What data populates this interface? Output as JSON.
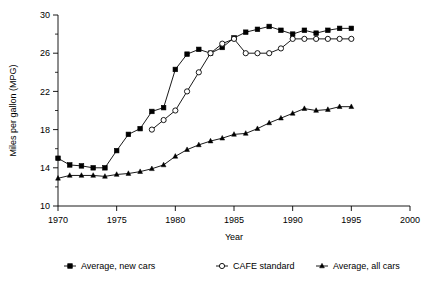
{
  "chart_data": {
    "type": "line",
    "title": "",
    "xlabel": "Year",
    "ylabel": "Miles per gallon (MPG)",
    "xlim": [
      1970,
      2000
    ],
    "ylim": [
      10,
      30
    ],
    "xticks": [
      1970,
      1975,
      1980,
      1985,
      1990,
      1995,
      2000
    ],
    "xtick_labels": [
      "1970",
      "1975",
      "1980",
      "1985",
      "1990",
      "1995",
      "2000"
    ],
    "yticks": [
      10,
      14,
      18,
      22,
      26,
      30
    ],
    "ytick_labels": [
      "10",
      "14",
      "18",
      "22",
      "26",
      "30"
    ],
    "yminor_ticks": [
      12,
      16,
      20,
      24,
      28
    ],
    "grid": false,
    "legend_position": "below",
    "series": [
      {
        "name": "Average, new cars",
        "marker": "filled-square",
        "color": "#000000",
        "x": [
          1970,
          1971,
          1972,
          1973,
          1974,
          1975,
          1976,
          1977,
          1978,
          1979,
          1980,
          1981,
          1982,
          1983,
          1984,
          1985,
          1986,
          1987,
          1988,
          1989,
          1990,
          1991,
          1992,
          1993,
          1994,
          1995
        ],
        "y": [
          15.0,
          14.3,
          14.2,
          14.0,
          14.0,
          15.8,
          17.5,
          18.1,
          19.9,
          20.3,
          24.3,
          25.9,
          26.4,
          26.0,
          26.6,
          27.6,
          28.2,
          28.5,
          28.8,
          28.4,
          28.0,
          28.4,
          28.1,
          28.4,
          28.6,
          28.6
        ]
      },
      {
        "name": "CAFE standard",
        "marker": "open-circle",
        "color": "#000000",
        "x": [
          1978,
          1979,
          1980,
          1981,
          1982,
          1983,
          1984,
          1985,
          1986,
          1987,
          1988,
          1989,
          1990,
          1991,
          1992,
          1993,
          1994,
          1995
        ],
        "y": [
          18.0,
          19.0,
          20.0,
          22.0,
          24.0,
          26.0,
          27.0,
          27.5,
          26.0,
          26.0,
          26.0,
          26.5,
          27.5,
          27.5,
          27.5,
          27.5,
          27.5,
          27.5
        ]
      },
      {
        "name": "Average, all cars",
        "marker": "filled-triangle",
        "color": "#000000",
        "x": [
          1970,
          1971,
          1972,
          1973,
          1974,
          1975,
          1976,
          1977,
          1978,
          1979,
          1980,
          1981,
          1982,
          1983,
          1984,
          1985,
          1986,
          1987,
          1988,
          1989,
          1990,
          1991,
          1992,
          1993,
          1994,
          1995
        ],
        "y": [
          12.9,
          13.2,
          13.2,
          13.2,
          13.1,
          13.3,
          13.4,
          13.6,
          13.9,
          14.3,
          15.2,
          15.9,
          16.4,
          16.8,
          17.1,
          17.5,
          17.6,
          18.1,
          18.7,
          19.2,
          19.7,
          20.2,
          20.0,
          20.1,
          20.4,
          20.4
        ]
      }
    ]
  },
  "legend": {
    "items": [
      {
        "label": "Average, new cars",
        "marker": "filled-square"
      },
      {
        "label": "CAFE standard",
        "marker": "open-circle"
      },
      {
        "label": "Average, all cars",
        "marker": "filled-triangle"
      }
    ]
  }
}
